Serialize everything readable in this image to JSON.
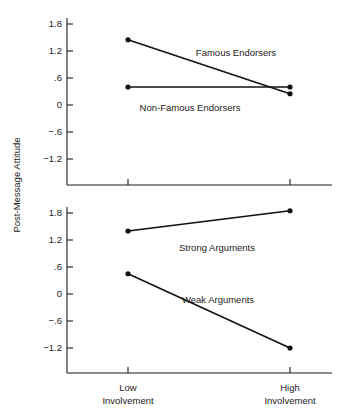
{
  "chart_data": {
    "type": "line",
    "title": "",
    "xlabel": "",
    "ylabel": "Post-Message Attitude",
    "grid": false,
    "legend_position": "inline-annotations",
    "x": [
      "Low Involvement",
      "High Involvement"
    ],
    "xtick_labels": [
      {
        "line1": "Low",
        "line2": "Involvement"
      },
      {
        "line1": "High",
        "line2": "Involvement"
      }
    ],
    "panels": [
      {
        "name": "upper-panel",
        "ylim": [
          -1.5,
          1.8
        ],
        "ytick_labels": [
          "1.8",
          "1.2",
          ".6",
          "0",
          "−.6",
          "−1.2"
        ],
        "ytick_values": [
          1.8,
          1.2,
          0.6,
          0,
          -0.6,
          -1.2
        ],
        "series": [
          {
            "name": "Famous Endorsers",
            "values": [
              1.45,
              0.25
            ]
          },
          {
            "name": "Non-Famous Endorsers",
            "values": [
              0.4,
              0.4
            ]
          }
        ]
      },
      {
        "name": "lower-panel",
        "ylim": [
          -1.5,
          1.8
        ],
        "ytick_labels": [
          "1.8",
          "1.2",
          ".6",
          "0",
          "−.6",
          "−1.2"
        ],
        "ytick_values": [
          1.8,
          1.2,
          0.6,
          0,
          -0.6,
          -1.2
        ],
        "series": [
          {
            "name": "Strong Arguments",
            "values": [
              1.4,
              1.85
            ]
          },
          {
            "name": "Weak Arguments",
            "values": [
              0.45,
              -1.2
            ]
          }
        ]
      }
    ],
    "annotations": [
      {
        "text": "Famous Endorsers",
        "panel": 0,
        "x": 236,
        "y": 53
      },
      {
        "text": "Non-Famous Endorsers",
        "panel": 0,
        "x": 190,
        "y": 108
      },
      {
        "text": "Strong Arguments",
        "panel": 1,
        "x": 217,
        "y": 248
      },
      {
        "text": "Weak Arguments",
        "panel": 1,
        "x": 218,
        "y": 300
      }
    ],
    "colors": {
      "line": "#111111",
      "axis": "#1a1a1a",
      "background": "#ffffff"
    }
  }
}
